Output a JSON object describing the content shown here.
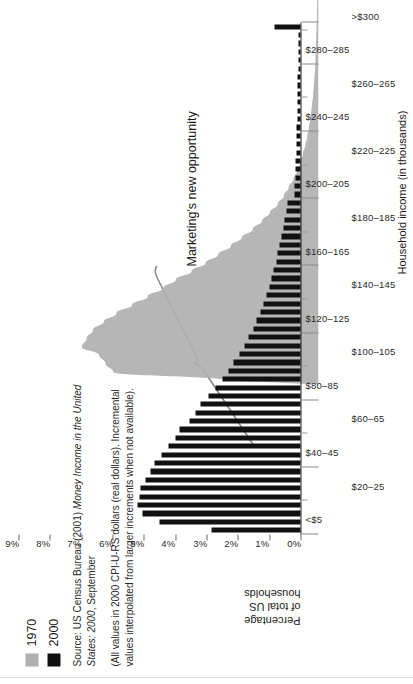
{
  "legend": {
    "position": "top-left",
    "items": [
      {
        "label": "1970",
        "color": "#b0b0b0"
      },
      {
        "label": "2000",
        "color": "#111111"
      }
    ]
  },
  "source_note": {
    "paragraph1_plain_a": "Source: US Census Bureau (2001) ",
    "paragraph1_italic": "Money Income in the United States: 2000",
    "paragraph1_plain_b": ", September",
    "paragraph2": "(All values in 2000 CPI-U-RS dollars (real dollars). Incremental values interpolated from larger increments when not available)."
  },
  "annotation": {
    "text": "Marketing's new opportunity",
    "color": "#7a7a7a"
  },
  "axes": {
    "x_title": "Household income (in thousands)",
    "y_title": "Percentage\nof total US\nhouseholds",
    "y_ticks": [
      "0%",
      "1%",
      "2%",
      "3%",
      "4%",
      "5%",
      "6%",
      "7%",
      "8%",
      "9%"
    ],
    "x_labels_row1": [
      "<$5",
      "$40–45",
      "$80–85",
      "$120–125",
      "$160–165",
      "$200–205",
      "$240–245",
      "$280–285"
    ],
    "x_labels_row2": [
      "$20–25",
      "$60–65",
      "$100–105",
      "$140–145",
      "$180–185",
      "$220–225",
      "$260–265",
      ">$300"
    ]
  },
  "chart_data": {
    "type": "bar",
    "orientation": "rotated-90",
    "title": "",
    "xlabel": "Household income (in thousands)",
    "ylabel": "Percentage of total US households",
    "ylim": [
      0,
      9
    ],
    "ytick_values": [
      0,
      1,
      2,
      3,
      4,
      5,
      6,
      7,
      8,
      9
    ],
    "ytick_labels": [
      "0%",
      "1%",
      "2%",
      "3%",
      "4%",
      "5%",
      "6%",
      "7%",
      "8%",
      "9%"
    ],
    "grid": false,
    "legend_position": "top-left",
    "categories": [
      "<$5",
      "$5–10",
      "$10–15",
      "$15–20",
      "$20–25",
      "$25–30",
      "$30–35",
      "$35–40",
      "$40–45",
      "$45–50",
      "$50–55",
      "$55–60",
      "$60–65",
      "$65–70",
      "$70–75",
      "$75–80",
      "$80–85",
      "$85–90",
      "$90–95",
      "$95–100",
      "$100–105",
      "$105–110",
      "$110–115",
      "$115–120",
      "$120–125",
      "$125–130",
      "$130–135",
      "$135–140",
      "$140–145",
      "$145–150",
      "$150–155",
      "$155–160",
      "$160–165",
      "$165–170",
      "$170–175",
      "$175–180",
      "$180–185",
      "$185–190",
      "$190–195",
      "$195–200",
      "$200–205",
      "$205–210",
      "$210–215",
      "$215–220",
      "$220–225",
      "$225–230",
      "$230–235",
      "$235–240",
      "$240–245",
      "$245–250",
      "$250–255",
      "$255–260",
      "$260–265",
      "$265–270",
      "$270–275",
      "$275–280",
      "$280–285",
      "$285–290",
      "$290–295",
      "$295–300",
      ">$300"
    ],
    "series": [
      {
        "name": "1970",
        "color": "#b0b0b0",
        "style": "filled-area",
        "values": [
          2.95,
          6.55,
          6.8,
          7.0,
          7.55,
          7.4,
          7.2,
          6.85,
          6.45,
          5.95,
          5.45,
          4.95,
          4.55,
          4.05,
          3.6,
          3.2,
          2.8,
          2.45,
          2.1,
          1.8,
          1.55,
          1.3,
          1.1,
          0.95,
          0.8,
          0.68,
          0.58,
          0.5,
          0.42,
          0.36,
          0.31,
          0.27,
          0.23,
          0.2,
          0.17,
          0.15,
          0.13,
          0.11,
          0.1,
          0.09,
          0.08,
          0.07,
          0.06,
          0.05,
          0.05,
          0.04,
          0.04,
          0.03,
          0.03,
          0.03,
          0.02,
          0.02,
          0.02,
          0.02,
          0.01,
          0.01,
          0.01,
          0.01,
          0.01,
          0.01,
          0.05
        ]
      },
      {
        "name": "2000",
        "color": "#111111",
        "style": "bars",
        "values": [
          2.85,
          4.5,
          5.05,
          5.2,
          5.15,
          5.1,
          4.95,
          4.8,
          4.65,
          4.45,
          4.2,
          4.0,
          3.85,
          3.55,
          3.35,
          3.2,
          2.95,
          2.7,
          2.5,
          2.3,
          2.15,
          1.95,
          1.8,
          1.65,
          1.5,
          1.4,
          1.28,
          1.18,
          1.08,
          1.0,
          0.92,
          0.85,
          0.78,
          0.72,
          0.66,
          0.6,
          0.55,
          0.5,
          0.46,
          0.42,
          0.2,
          0.18,
          0.17,
          0.16,
          0.15,
          0.14,
          0.13,
          0.13,
          0.12,
          0.11,
          0.11,
          0.1,
          0.1,
          0.09,
          0.09,
          0.08,
          0.08,
          0.08,
          0.07,
          0.07,
          0.82
        ]
      }
    ],
    "annotations": [
      {
        "text": "Marketing's new opportunity",
        "brace_from_category": "$60–65",
        "brace_to_category": "$180–185"
      }
    ]
  }
}
